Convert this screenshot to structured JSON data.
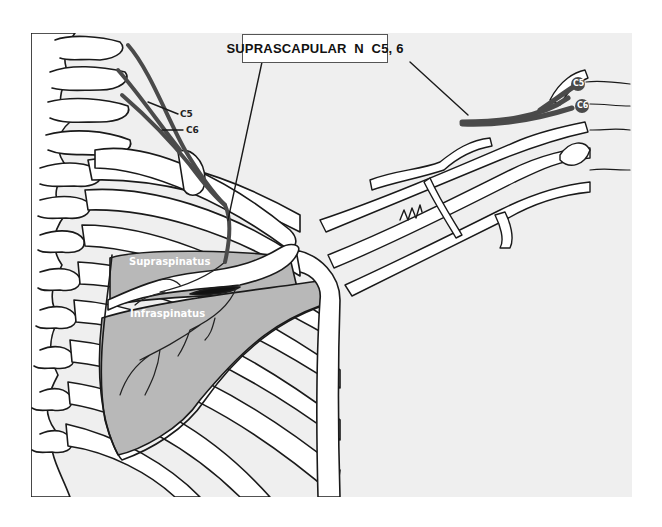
{
  "diagram": {
    "title": "SUPRASCAPULAR  N  C5, 6",
    "labels": {
      "c5_left": "C5",
      "c6_left": "C6",
      "supraspinatus": "Supraspinatus",
      "infraspinatus": "Infraspinatus",
      "c5_right": "C5",
      "c6_right": "C6"
    },
    "colors": {
      "background_panel": "#efefef",
      "nerve": "#555555",
      "muscle_fill": "#b8b8b8",
      "bone_fill": "#ffffff",
      "outline": "#1a1a1a"
    },
    "views": [
      "posterior-shoulder-view",
      "brachial-plexus-view"
    ]
  }
}
